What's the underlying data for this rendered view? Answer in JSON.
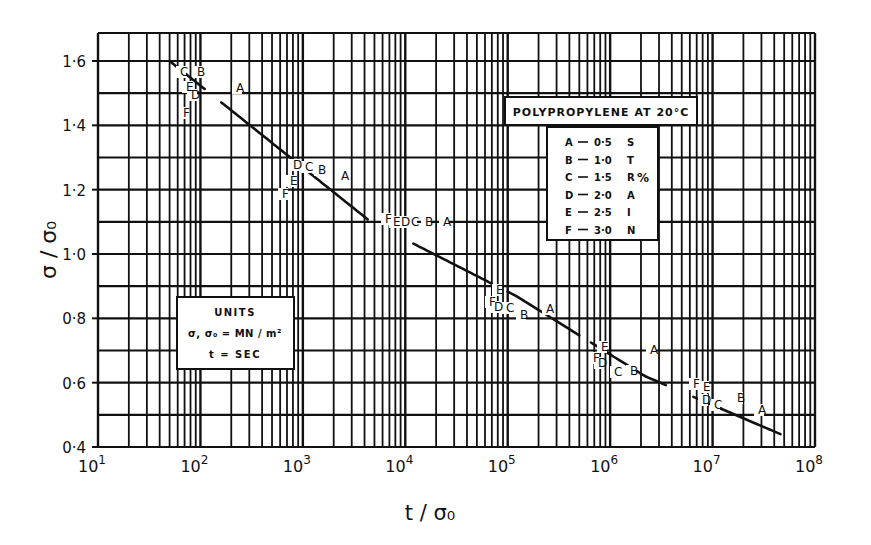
{
  "chart_data": {
    "type": "line",
    "title": "POLYPROPYLENE AT 20°C",
    "xlabel": "t / σ₀",
    "ylabel": "σ / σ₀",
    "xscale": "log",
    "xlim": [
      10,
      100000000
    ],
    "ylim": [
      0.4,
      1.69
    ],
    "grid": true,
    "x_tick_labels": [
      {
        "base": "10",
        "exp": "1"
      },
      {
        "base": "10",
        "exp": "2"
      },
      {
        "base": "10",
        "exp": "3"
      },
      {
        "base": "10",
        "exp": "4"
      },
      {
        "base": "10",
        "exp": "5"
      },
      {
        "base": "10",
        "exp": "6"
      },
      {
        "base": "10",
        "exp": "7"
      },
      {
        "base": "10",
        "exp": "8"
      }
    ],
    "y_tick_labels": [
      "0·4",
      "0·6",
      "0·8",
      "1·0",
      "1·2",
      "1·4",
      "1·6"
    ],
    "y_tick_values": [
      0.4,
      0.6,
      0.8,
      1.0,
      1.2,
      1.4,
      1.6
    ],
    "series": [
      {
        "name": "Master creep curve",
        "points": [
          {
            "x": 50,
            "y": 1.6
          },
          {
            "x": 4600,
            "y": 1.1
          },
          {
            "x": 120000,
            "y": 0.87
          },
          {
            "x": 2200000,
            "y": 0.62
          },
          {
            "x": 46000000,
            "y": 0.44
          }
        ]
      }
    ],
    "line_gaps": [
      {
        "x_start": 110,
        "x_end": 160
      },
      {
        "x_start": 800,
        "x_end": 1100
      },
      {
        "x_start": 4300,
        "x_end": 12000
      },
      {
        "x_start": 70000,
        "x_end": 100000
      },
      {
        "x_start": 500000,
        "x_end": 650000
      },
      {
        "x_start": 3500000,
        "x_end": 6500000
      }
    ],
    "point_labels": [
      {
        "text": "C",
        "px": 180,
        "py": 76
      },
      {
        "text": "B",
        "px": 197,
        "py": 76
      },
      {
        "text": "A",
        "px": 236,
        "py": 92
      },
      {
        "text": "E",
        "px": 186,
        "py": 91
      },
      {
        "text": "D",
        "px": 191,
        "py": 99
      },
      {
        "text": "F",
        "px": 183,
        "py": 117
      },
      {
        "text": "D",
        "px": 293,
        "py": 169
      },
      {
        "text": "C",
        "px": 305,
        "py": 171
      },
      {
        "text": "B",
        "px": 318,
        "py": 174
      },
      {
        "text": "A",
        "px": 341,
        "py": 180
      },
      {
        "text": "E",
        "px": 290,
        "py": 185
      },
      {
        "text": "F",
        "px": 282,
        "py": 198
      },
      {
        "text": "F",
        "px": 385,
        "py": 223
      },
      {
        "text": "E",
        "px": 393,
        "py": 226
      },
      {
        "text": "D",
        "px": 401,
        "py": 226
      },
      {
        "text": "C",
        "px": 411,
        "py": 226
      },
      {
        "text": "B",
        "px": 425,
        "py": 226
      },
      {
        "text": "A",
        "px": 443,
        "py": 226
      },
      {
        "text": "E",
        "px": 496,
        "py": 294
      },
      {
        "text": "F",
        "px": 489,
        "py": 306
      },
      {
        "text": "D",
        "px": 494,
        "py": 311
      },
      {
        "text": "C",
        "px": 506,
        "py": 312
      },
      {
        "text": "B",
        "px": 520,
        "py": 319
      },
      {
        "text": "A",
        "px": 546,
        "py": 313
      },
      {
        "text": "E",
        "px": 601,
        "py": 351
      },
      {
        "text": "F",
        "px": 593,
        "py": 362
      },
      {
        "text": "D",
        "px": 598,
        "py": 367
      },
      {
        "text": "C",
        "px": 614,
        "py": 376
      },
      {
        "text": "B",
        "px": 630,
        "py": 375
      },
      {
        "text": "A",
        "px": 650,
        "py": 354
      },
      {
        "text": "F",
        "px": 693,
        "py": 388
      },
      {
        "text": "E",
        "px": 703,
        "py": 391
      },
      {
        "text": "D",
        "px": 702,
        "py": 404
      },
      {
        "text": "C",
        "px": 714,
        "py": 409
      },
      {
        "text": "B",
        "px": 737,
        "py": 402
      },
      {
        "text": "A",
        "px": 758,
        "py": 414
      }
    ],
    "legend": {
      "title": "STRAIN %",
      "side_label_letters": [
        "S",
        "T",
        "R",
        "A",
        "I",
        "N"
      ],
      "percent_symbol": "%",
      "entries": [
        {
          "key": "A",
          "value": "0·5"
        },
        {
          "key": "B",
          "value": "1·0"
        },
        {
          "key": "C",
          "value": "1·5"
        },
        {
          "key": "D",
          "value": "2·0"
        },
        {
          "key": "E",
          "value": "2·5"
        },
        {
          "key": "F",
          "value": "3·0"
        }
      ]
    },
    "units_box": {
      "title": "UNITS",
      "line1": "σ, σ₀ = MN / m²",
      "line2": "t = SEC"
    }
  },
  "colors": {
    "ink": "#111111",
    "paper": "#ffffff"
  }
}
